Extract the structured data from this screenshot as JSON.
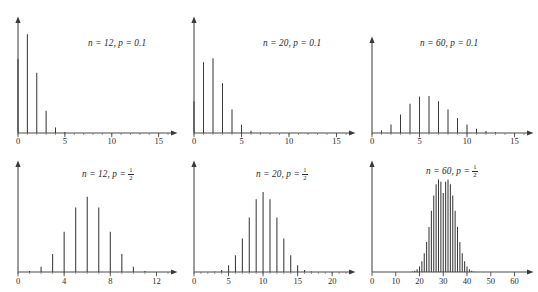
{
  "figure": {
    "background": "#ffffff",
    "stem_color": "#3a3a3a",
    "axis_color": "#4a4a4a",
    "text_color": "#2a2a2a",
    "rows": 2,
    "columns": 3
  },
  "panels": [
    {
      "id": "panel-n12-p01",
      "label_prefix": "n",
      "label": "n = 12, p = 0.1",
      "n_text": "12",
      "p_text": "0.1",
      "p_is_fraction": false,
      "xticks": [
        "0",
        "5",
        "10",
        "15"
      ]
    },
    {
      "id": "panel-n20-p01",
      "label_prefix": "n",
      "label": "n = 20, p = 0.1",
      "n_text": "20",
      "p_text": "0.1",
      "p_is_fraction": false,
      "xticks": [
        "0",
        "5",
        "10",
        "15"
      ]
    },
    {
      "id": "panel-n60-p01",
      "label_prefix": "n",
      "label": "n = 60, p = 0.1",
      "n_text": "60",
      "p_text": "0.1",
      "p_is_fraction": false,
      "xticks": [
        "0",
        "5",
        "10",
        "15"
      ]
    },
    {
      "id": "panel-n12-phalf",
      "label_prefix": "n",
      "label": "n = 12, p = 1/2",
      "n_text": "12",
      "p_text": "1/2",
      "p_is_fraction": true,
      "p_num": "1",
      "p_den": "2",
      "xticks": [
        "0",
        "4",
        "8",
        "12"
      ]
    },
    {
      "id": "panel-n20-phalf",
      "label_prefix": "n",
      "label": "n = 20, p = 1/2",
      "n_text": "20",
      "p_text": "1/2",
      "p_is_fraction": true,
      "p_num": "1",
      "p_den": "2",
      "xticks": [
        "0",
        "5",
        "10",
        "15",
        "20"
      ]
    },
    {
      "id": "panel-n60-phalf",
      "label_prefix": "n",
      "label": "n = 60, p = 1/2",
      "n_text": "60",
      "p_text": "1/2",
      "p_is_fraction": true,
      "p_num": "1",
      "p_den": "2",
      "xticks": [
        "0",
        "10",
        "20",
        "30",
        "40",
        "50",
        "60"
      ]
    }
  ],
  "chart_data": [
    {
      "type": "bar",
      "id": "panel-n12-p01",
      "title": "n = 12, p = 0.1",
      "distribution": "binomial",
      "n": 12,
      "p": 0.1,
      "xlabel": "",
      "ylabel": "",
      "grid": false,
      "legend": "none",
      "xlim": [
        0,
        16
      ],
      "ylim": [
        0,
        0.42
      ],
      "xticks": [
        0,
        5,
        10,
        15
      ],
      "categories": [
        0,
        1,
        2,
        3,
        4,
        5,
        6,
        7,
        8,
        9,
        10,
        11,
        12
      ],
      "values": [
        0.2824,
        0.3766,
        0.2301,
        0.0852,
        0.0213,
        0.0038,
        0.0005,
        5e-05,
        4e-06,
        0,
        0,
        0,
        0
      ]
    },
    {
      "type": "bar",
      "id": "panel-n20-p01",
      "title": "n = 20, p = 0.1",
      "distribution": "binomial",
      "n": 20,
      "p": 0.1,
      "xlabel": "",
      "ylabel": "",
      "grid": false,
      "legend": "none",
      "xlim": [
        0,
        16
      ],
      "ylim": [
        0,
        0.42
      ],
      "xticks": [
        0,
        5,
        10,
        15
      ],
      "categories": [
        0,
        1,
        2,
        3,
        4,
        5,
        6,
        7,
        8,
        9,
        10,
        11,
        12,
        13,
        14,
        15,
        16,
        17,
        18,
        19,
        20
      ],
      "values": [
        0.1216,
        0.2702,
        0.2852,
        0.1901,
        0.0898,
        0.0319,
        0.0089,
        0.002,
        0.0004,
        0.0001,
        0,
        0,
        0,
        0,
        0,
        0,
        0,
        0,
        0,
        0,
        0
      ]
    },
    {
      "type": "bar",
      "id": "panel-n60-p01",
      "title": "n = 60, p = 0.1",
      "distribution": "binomial",
      "n": 60,
      "p": 0.1,
      "xlabel": "",
      "ylabel": "",
      "grid": false,
      "legend": "none",
      "xlim": [
        0,
        16
      ],
      "ylim": [
        0,
        0.42
      ],
      "xticks": [
        0,
        5,
        10,
        15
      ],
      "categories": [
        0,
        1,
        2,
        3,
        4,
        5,
        6,
        7,
        8,
        9,
        10,
        11,
        12,
        13,
        14,
        15
      ],
      "values": [
        0.0018,
        0.012,
        0.0393,
        0.0844,
        0.1336,
        0.1662,
        0.1693,
        0.1451,
        0.1068,
        0.0686,
        0.0388,
        0.0196,
        0.0089,
        0.0037,
        0.0014,
        0.0005
      ]
    },
    {
      "type": "bar",
      "id": "panel-n12-phalf",
      "title": "n = 12, p = 1/2",
      "distribution": "binomial",
      "n": 12,
      "p": 0.5,
      "xlabel": "",
      "ylabel": "",
      "grid": false,
      "legend": "none",
      "xlim": [
        0,
        13
      ],
      "ylim": [
        0,
        0.3
      ],
      "xticks": [
        0,
        4,
        8,
        12
      ],
      "categories": [
        0,
        1,
        2,
        3,
        4,
        5,
        6,
        7,
        8,
        9,
        10,
        11,
        12
      ],
      "values": [
        0.0002,
        0.0029,
        0.0161,
        0.0537,
        0.1208,
        0.1934,
        0.2256,
        0.1934,
        0.1208,
        0.0537,
        0.0161,
        0.0029,
        0.0002
      ]
    },
    {
      "type": "bar",
      "id": "panel-n20-phalf",
      "title": "n = 20, p = 1/2",
      "distribution": "binomial",
      "n": 20,
      "p": 0.5,
      "xlabel": "",
      "ylabel": "",
      "grid": false,
      "legend": "none",
      "xlim": [
        0,
        22
      ],
      "ylim": [
        0,
        0.22
      ],
      "xticks": [
        0,
        5,
        10,
        15,
        20
      ],
      "categories": [
        0,
        1,
        2,
        3,
        4,
        5,
        6,
        7,
        8,
        9,
        10,
        11,
        12,
        13,
        14,
        15,
        16,
        17,
        18,
        19,
        20
      ],
      "values": [
        1e-06,
        2e-05,
        0.0002,
        0.0011,
        0.0046,
        0.0148,
        0.037,
        0.0739,
        0.1201,
        0.1602,
        0.1762,
        0.1602,
        0.1201,
        0.0739,
        0.037,
        0.0148,
        0.0046,
        0.0011,
        0.0002,
        2e-05,
        1e-06
      ]
    },
    {
      "type": "bar",
      "id": "panel-n60-phalf",
      "title": "n = 60, p = 1/2",
      "distribution": "binomial",
      "n": 60,
      "p": 0.5,
      "xlabel": "",
      "ylabel": "",
      "grid": false,
      "legend": "none",
      "xlim": [
        0,
        64
      ],
      "ylim": [
        0,
        0.13
      ],
      "xticks": [
        0,
        10,
        20,
        30,
        40,
        50,
        60
      ],
      "categories": [
        15,
        16,
        17,
        18,
        19,
        20,
        21,
        22,
        23,
        24,
        25,
        26,
        27,
        28,
        29,
        30,
        31,
        32,
        33,
        34,
        35,
        36,
        37,
        38,
        39,
        40,
        41,
        42,
        43,
        44,
        45
      ],
      "values": [
        0.0001,
        0.0002,
        0.0006,
        0.0015,
        0.0035,
        0.0073,
        0.0139,
        0.0243,
        0.0391,
        0.0586,
        0.0796,
        0.0994,
        0.1141,
        0.1204,
        0.1173,
        0.1026,
        0.1173,
        0.1204,
        0.1141,
        0.0994,
        0.0796,
        0.0586,
        0.0391,
        0.0243,
        0.0139,
        0.0073,
        0.0035,
        0.0015,
        0.0006,
        0.0002,
        0.0001
      ]
    }
  ]
}
